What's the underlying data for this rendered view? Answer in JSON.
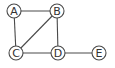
{
  "graph": {
    "nodes": [
      {
        "id": "A",
        "label": "A",
        "x": 14,
        "y": 11
      },
      {
        "id": "B",
        "label": "B",
        "x": 57,
        "y": 11
      },
      {
        "id": "C",
        "label": "C",
        "x": 16,
        "y": 53
      },
      {
        "id": "D",
        "label": "D",
        "x": 58,
        "y": 53
      },
      {
        "id": "E",
        "label": "E",
        "x": 99,
        "y": 53
      }
    ],
    "edges": [
      {
        "from": "A",
        "to": "B"
      },
      {
        "from": "A",
        "to": "C"
      },
      {
        "from": "B",
        "to": "C"
      },
      {
        "from": "B",
        "to": "D"
      },
      {
        "from": "C",
        "to": "D"
      },
      {
        "from": "D",
        "to": "E"
      }
    ],
    "node_radius": 7,
    "colors": {
      "stroke": "#4a4a4a",
      "fill": "#ffffff",
      "label": "#333333"
    }
  }
}
